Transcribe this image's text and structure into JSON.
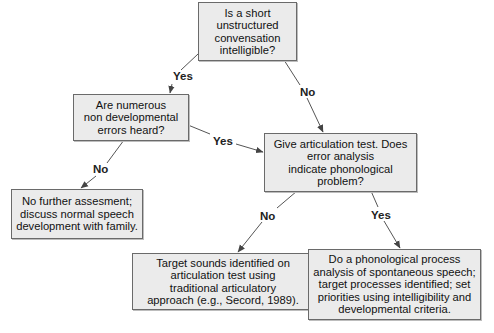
{
  "diagram": {
    "type": "flowchart",
    "nodes": [
      {
        "id": "q1",
        "text": "Is a short unstructured\nconvensation\nintelligible?"
      },
      {
        "id": "q2",
        "text": "Are numerous\nnon developmental\nerrors heard?"
      },
      {
        "id": "q3",
        "text": "Give articulation test. Does\nerror analysis\nindicate phonological\nproblem?"
      },
      {
        "id": "r1",
        "text": "No further assesment;\ndiscuss normal speech\ndevelopment with family."
      },
      {
        "id": "r2",
        "text": "Target sounds identified on\narticulation test using\ntraditional articulatory\napproach (e.g., Secord, 1989)."
      },
      {
        "id": "r3",
        "text": "Do a phonological process\nanalysis of spontaneous speech;\ntarget processes identified; set\npriorities using intelligibility and\ndevelopmental criteria."
      }
    ],
    "edges": [
      {
        "from": "q1",
        "to": "q2",
        "label": "Yes"
      },
      {
        "from": "q1",
        "to": "q3",
        "label": "No"
      },
      {
        "from": "q2",
        "to": "q3",
        "label": "Yes"
      },
      {
        "from": "q2",
        "to": "r1",
        "label": "No"
      },
      {
        "from": "q3",
        "to": "r2",
        "label": "No"
      },
      {
        "from": "q3",
        "to": "r3",
        "label": "Yes"
      }
    ]
  }
}
